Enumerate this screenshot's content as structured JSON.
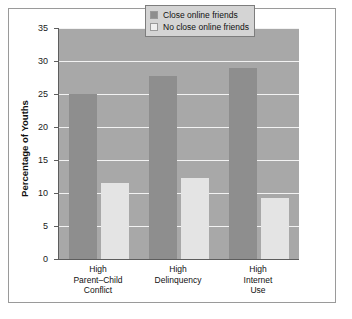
{
  "chart_data": {
    "type": "bar",
    "title": "",
    "xlabel": "",
    "ylabel": "Percentage of Youths",
    "ylim": [
      0,
      35
    ],
    "yticks": [
      0,
      5,
      10,
      15,
      20,
      25,
      30,
      35
    ],
    "ytick_labels": [
      "0",
      "5",
      "10",
      "15",
      "20",
      "25",
      "30",
      "35"
    ],
    "grid": true,
    "legend_position": "upper right",
    "categories": [
      "High\nParent–Child\nConflict",
      "High\nDelinquency",
      "High\nInternet\nUse"
    ],
    "category_lines": [
      [
        "High",
        "Parent–Child",
        "Conflict"
      ],
      [
        "High",
        "Delinquency"
      ],
      [
        "High",
        "Internet",
        "Use"
      ]
    ],
    "series": [
      {
        "name": "Close online friends",
        "color": "#8e8e8e",
        "values": [
          25.0,
          27.8,
          29.0
        ]
      },
      {
        "name": "No close online friends",
        "color": "#e4e4e4",
        "values": [
          11.5,
          12.3,
          9.2
        ]
      }
    ]
  },
  "legend": {
    "items": [
      {
        "label": "Close online friends"
      },
      {
        "label": "No close online friends"
      }
    ]
  },
  "colors": {
    "plot_background": "#a8a8a8",
    "gridline": "#f2f2f2",
    "axis": "#5d5d5d",
    "frame": "#9a9a9a",
    "page_background": "#ffffff",
    "series_dark": "#8e8e8e",
    "series_light": "#e4e4e4",
    "legend_background": "#d4d4d4",
    "text": "#111111"
  }
}
